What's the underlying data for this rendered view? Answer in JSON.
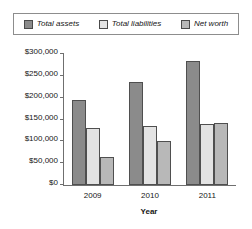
{
  "chart_data": {
    "type": "bar",
    "title": "",
    "xlabel": "Year",
    "ylabel": "",
    "categories": [
      "2009",
      "2010",
      "2011"
    ],
    "series": [
      {
        "name": "Total assets",
        "values": [
          195000,
          235000,
          285000
        ],
        "color": "#8b8b8b"
      },
      {
        "name": "Total liabilities",
        "values": [
          130000,
          135000,
          140000
        ],
        "color": "#e3e3e3"
      },
      {
        "name": "Net worth",
        "values": [
          65000,
          101000,
          143000
        ],
        "color": "#b8b8b8"
      }
    ],
    "ylim": [
      0,
      300000
    ],
    "yticks": [
      0,
      50000,
      100000,
      150000,
      200000,
      250000,
      300000
    ],
    "ytick_labels": [
      "$0",
      "$50,000",
      "$100,000",
      "$150,000",
      "$200,000",
      "$250,000",
      "$300,000"
    ],
    "grid": false,
    "legend_position": "top"
  },
  "legend": {
    "items": [
      {
        "label": "Total assets"
      },
      {
        "label": "Total liabilities"
      },
      {
        "label": "Net worth"
      }
    ]
  },
  "axis": {
    "x_title": "Year"
  }
}
